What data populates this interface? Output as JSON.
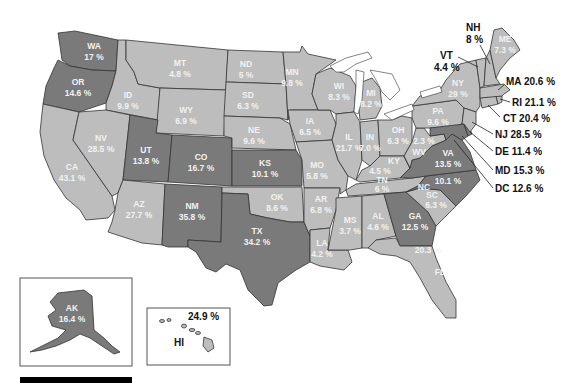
{
  "map": {
    "type": "choropleth",
    "region": "United States",
    "colors": {
      "high": "#7a7a7a",
      "low": "#bdbdbd",
      "border": "#333333",
      "background": "#ffffff"
    },
    "states": {
      "WA": {
        "abbr": "WA",
        "value": "17 %",
        "tier": "high"
      },
      "OR": {
        "abbr": "OR",
        "value": "14.6 %",
        "tier": "high"
      },
      "CA": {
        "abbr": "CA",
        "value": "43.1 %",
        "tier": "low"
      },
      "ID": {
        "abbr": "ID",
        "value": "9.9 %",
        "tier": "low"
      },
      "NV": {
        "abbr": "NV",
        "value": "28.5 %",
        "tier": "low"
      },
      "MT": {
        "abbr": "MT",
        "value": "4.8 %",
        "tier": "low"
      },
      "WY": {
        "abbr": "WY",
        "value": "6.9 %",
        "tier": "low"
      },
      "UT": {
        "abbr": "UT",
        "value": "13.8 %",
        "tier": "high"
      },
      "CO": {
        "abbr": "CO",
        "value": "16.7 %",
        "tier": "high"
      },
      "AZ": {
        "abbr": "AZ",
        "value": "27.7 %",
        "tier": "low"
      },
      "NM": {
        "abbr": "NM",
        "value": "35.8 %",
        "tier": "high"
      },
      "ND": {
        "abbr": "ND",
        "value": "5 %",
        "tier": "low"
      },
      "SD": {
        "abbr": "SD",
        "value": "6.3 %",
        "tier": "low"
      },
      "NE": {
        "abbr": "NE",
        "value": "9.6 %",
        "tier": "low"
      },
      "KS": {
        "abbr": "KS",
        "value": "10.1 %",
        "tier": "high"
      },
      "OK": {
        "abbr": "OK",
        "value": "8.6 %",
        "tier": "low"
      },
      "TX": {
        "abbr": "TX",
        "value": "34.2 %",
        "tier": "high"
      },
      "MN": {
        "abbr": "MN",
        "value": "9.8 %",
        "tier": "low"
      },
      "IA": {
        "abbr": "IA",
        "value": "6.5 %",
        "tier": "low"
      },
      "MO": {
        "abbr": "MO",
        "value": "5.8 %",
        "tier": "low"
      },
      "AR": {
        "abbr": "AR",
        "value": "6.8 %",
        "tier": "low"
      },
      "LA": {
        "abbr": "LA",
        "value": "4.2 %",
        "tier": "low"
      },
      "WI": {
        "abbr": "WI",
        "value": "8.3 %",
        "tier": "low"
      },
      "IL": {
        "abbr": "IL",
        "value": "21.7 %",
        "tier": "low"
      },
      "MI": {
        "abbr": "MI",
        "value": "8.2 %",
        "tier": "low"
      },
      "IN": {
        "abbr": "IN",
        "value": "7.0 %",
        "tier": "low"
      },
      "OH": {
        "abbr": "OH",
        "value": "6.3 %",
        "tier": "low"
      },
      "KY": {
        "abbr": "KY",
        "value": "4.5 %",
        "tier": "low"
      },
      "TN": {
        "abbr": "TN",
        "value": "6 %",
        "tier": "low"
      },
      "MS": {
        "abbr": "MS",
        "value": "3.7 %",
        "tier": "low"
      },
      "AL": {
        "abbr": "AL",
        "value": "4.6 %",
        "tier": "low"
      },
      "GA": {
        "abbr": "GA",
        "value": "12.5 %",
        "tier": "high"
      },
      "FL": {
        "abbr": "FL",
        "value": "20.3 %",
        "tier": "low"
      },
      "SC": {
        "abbr": "SC",
        "value": "6.3 %",
        "tier": "low"
      },
      "NC": {
        "abbr": "NC",
        "value": "10.1 %",
        "tier": "high"
      },
      "VA": {
        "abbr": "VA",
        "value": "13.5 %",
        "tier": "high"
      },
      "WV": {
        "abbr": "WV",
        "value": "2.3 %",
        "tier": "low"
      },
      "PA": {
        "abbr": "PA",
        "value": "9.6 %",
        "tier": "low"
      },
      "NY": {
        "abbr": "NY",
        "value": "29 %",
        "tier": "low"
      },
      "ME": {
        "abbr": "ME",
        "value": "7.3 %",
        "tier": "low"
      },
      "NH": {
        "abbr": "NH",
        "value": "8 %",
        "tier": "low"
      },
      "VT": {
        "abbr": "VT",
        "value": "4.4 %",
        "tier": "low"
      },
      "MA": {
        "abbr": "MA",
        "value": "20.6 %",
        "tier": "low"
      },
      "RI": {
        "abbr": "RI",
        "value": "21.1 %",
        "tier": "low"
      },
      "CT": {
        "abbr": "CT",
        "value": "20.4 %",
        "tier": "low"
      },
      "NJ": {
        "abbr": "NJ",
        "value": "28.5 %",
        "tier": "low"
      },
      "DE": {
        "abbr": "DE",
        "value": "11.4 %",
        "tier": "high"
      },
      "MD": {
        "abbr": "MD",
        "value": "15.3 %",
        "tier": "high"
      },
      "DC": {
        "abbr": "DC",
        "value": "12.6 %",
        "tier": "high"
      },
      "AK": {
        "abbr": "AK",
        "value": "16.4 %",
        "tier": "high"
      },
      "HI": {
        "abbr": "HI",
        "value": "24.9 %",
        "tier": "low"
      }
    },
    "external_labels": {
      "NH": "NH",
      "NH_value": "8 %",
      "VT": "VT",
      "VT_value": "4.4 %",
      "MA": "MA 20.6 %",
      "RI": "RI 21.1 %",
      "CT": "CT 20.4 %",
      "NJ": "NJ 28.5 %",
      "DE": "DE 11.4 %",
      "MD": "MD 15.3 %",
      "DC": "DC 12.6 %"
    },
    "scale_bar": {
      "visible": true
    }
  }
}
